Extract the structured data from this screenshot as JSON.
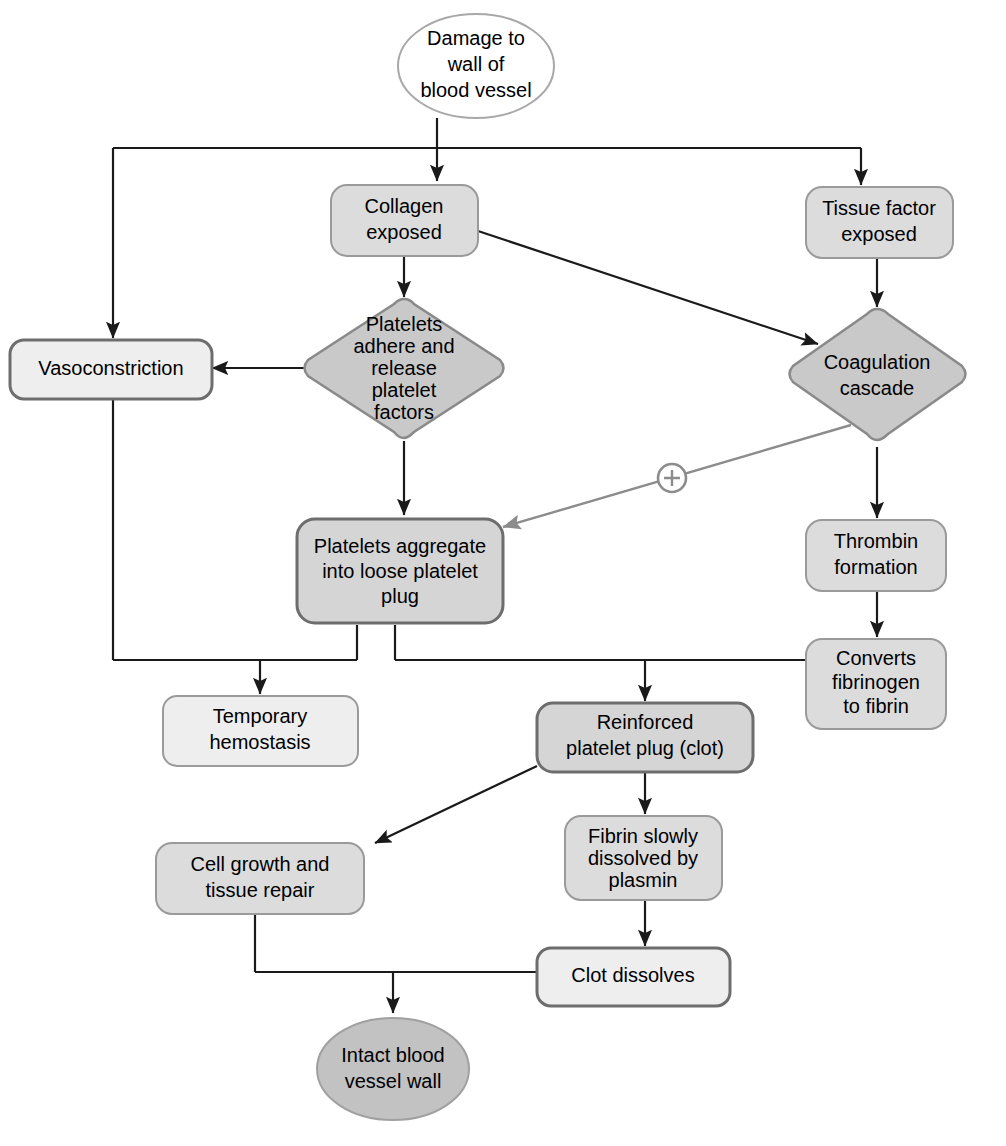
{
  "diagram": {
    "colors": {
      "node_light_fill": "#eeeeee",
      "node_mid_fill": "#dcdcdc",
      "diamond_fill": "#c9c9c9",
      "ellipse_gray_fill": "#c2c2c2",
      "ellipse_white_fill": "#ffffff",
      "border_light": "#9a9a9a",
      "border_dark": "#6d6d6d",
      "edge": "#1a1a1a",
      "edge_modulator": "#8c8c8c"
    },
    "nodes": [
      {
        "id": "damage",
        "label_lines": [
          "Damage to",
          "wall of",
          "blood vessel"
        ],
        "shape": "ellipse"
      },
      {
        "id": "collagen",
        "label_lines": [
          "Collagen",
          "exposed"
        ],
        "shape": "rounded-rect"
      },
      {
        "id": "tissue_factor",
        "label_lines": [
          "Tissue factor",
          "exposed"
        ],
        "shape": "rounded-rect"
      },
      {
        "id": "vasoconstriction",
        "label_lines": [
          "Vasoconstriction"
        ],
        "shape": "rounded-rect"
      },
      {
        "id": "platelets_adhere",
        "label_lines": [
          "Platelets",
          "adhere and",
          "release",
          "platelet",
          "factors"
        ],
        "shape": "diamond"
      },
      {
        "id": "coagulation",
        "label_lines": [
          "Coagulation",
          "cascade"
        ],
        "shape": "diamond"
      },
      {
        "id": "platelet_plug",
        "label_lines": [
          "Platelets aggregate",
          "into loose platelet",
          "plug"
        ],
        "shape": "rounded-rect"
      },
      {
        "id": "thrombin",
        "label_lines": [
          "Thrombin",
          "formation"
        ],
        "shape": "rounded-rect"
      },
      {
        "id": "converts",
        "label_lines": [
          "Converts",
          "fibrinogen",
          "to fibrin"
        ],
        "shape": "rounded-rect"
      },
      {
        "id": "temporary",
        "label_lines": [
          "Temporary",
          "hemostasis"
        ],
        "shape": "rounded-rect"
      },
      {
        "id": "reinforced",
        "label_lines": [
          "Reinforced",
          "platelet plug (clot)"
        ],
        "shape": "rounded-rect"
      },
      {
        "id": "fibrin_dissolved",
        "label_lines": [
          "Fibrin slowly",
          "dissolved by",
          "plasmin"
        ],
        "shape": "rounded-rect"
      },
      {
        "id": "cell_growth",
        "label_lines": [
          "Cell growth and",
          "tissue repair"
        ],
        "shape": "rounded-rect"
      },
      {
        "id": "clot_dissolves",
        "label_lines": [
          "Clot dissolves"
        ],
        "shape": "rounded-rect"
      },
      {
        "id": "intact",
        "label_lines": [
          "Intact blood",
          "vessel wall"
        ],
        "shape": "ellipse"
      }
    ],
    "edges": [
      {
        "from": "damage",
        "to": "collagen",
        "type": "arrow"
      },
      {
        "from": "damage",
        "to": "tissue_factor",
        "type": "arrow"
      },
      {
        "from": "damage",
        "to": "vasoconstriction",
        "type": "arrow"
      },
      {
        "from": "collagen",
        "to": "platelets_adhere",
        "type": "arrow"
      },
      {
        "from": "collagen",
        "to": "coagulation",
        "type": "arrow"
      },
      {
        "from": "tissue_factor",
        "to": "coagulation",
        "type": "arrow"
      },
      {
        "from": "platelets_adhere",
        "to": "vasoconstriction",
        "type": "arrow"
      },
      {
        "from": "platelets_adhere",
        "to": "platelet_plug",
        "type": "arrow"
      },
      {
        "from": "coagulation",
        "to": "platelet_plug",
        "type": "arrow-modulator",
        "marker": "+"
      },
      {
        "from": "coagulation",
        "to": "thrombin",
        "type": "arrow"
      },
      {
        "from": "thrombin",
        "to": "converts",
        "type": "arrow"
      },
      {
        "from": "vasoconstriction",
        "to": "temporary",
        "type": "arrow"
      },
      {
        "from": "platelet_plug",
        "to": "temporary",
        "type": "arrow"
      },
      {
        "from": "platelet_plug",
        "to": "reinforced",
        "type": "arrow"
      },
      {
        "from": "converts",
        "to": "reinforced",
        "type": "arrow"
      },
      {
        "from": "reinforced",
        "to": "fibrin_dissolved",
        "type": "arrow"
      },
      {
        "from": "reinforced",
        "to": "cell_growth",
        "type": "arrow"
      },
      {
        "from": "fibrin_dissolved",
        "to": "clot_dissolves",
        "type": "arrow"
      },
      {
        "from": "cell_growth",
        "to": "intact",
        "type": "arrow"
      },
      {
        "from": "clot_dissolves",
        "to": "intact",
        "type": "arrow"
      }
    ],
    "modulator_symbol": "+"
  }
}
